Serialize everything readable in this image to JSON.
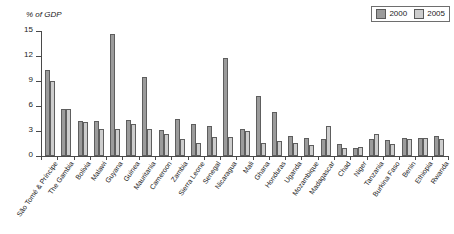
{
  "chart_data": {
    "type": "bar",
    "title": "",
    "subtitle": "",
    "ylabel": "% of GDP",
    "xlabel": "",
    "ylim": [
      0,
      15
    ],
    "yticks": [
      0,
      3,
      6,
      9,
      12,
      15
    ],
    "grid": false,
    "legend_position": "top-right",
    "categories": [
      "São Tomé & Príncipe",
      "The Gambia",
      "Bolivia",
      "Malawi",
      "Guyana",
      "Guinea",
      "Mauritania",
      "Cameroon",
      "Zambia",
      "Sierra Leone",
      "Senegal",
      "Nicaragua",
      "Mali",
      "Ghana",
      "Honduras",
      "Uganda",
      "Mozambique",
      "Madagascar",
      "Chad",
      "Niger",
      "Tanzania",
      "Burkina Faso",
      "Benin",
      "Ethiopia",
      "Rwanda"
    ],
    "series": [
      {
        "name": "2000",
        "color": "#9b9b9b",
        "values": [
          10.3,
          5.6,
          4.2,
          4.2,
          14.6,
          4.3,
          9.5,
          3.1,
          4.4,
          3.9,
          3.6,
          11.8,
          3.2,
          7.2,
          5.3,
          2.4,
          2.2,
          2.0,
          1.5,
          1.0,
          2.0,
          1.9,
          2.2,
          2.2,
          2.4
        ],
        "unit": "% of GDP"
      },
      {
        "name": "2005",
        "color": "#cdcdcd",
        "values": [
          9.0,
          5.6,
          4.1,
          3.3,
          3.2,
          3.9,
          3.2,
          2.7,
          2.1,
          1.6,
          2.3,
          2.3,
          3.0,
          1.6,
          1.8,
          1.6,
          1.3,
          3.6,
          1.0,
          1.1,
          2.6,
          1.5,
          2.0,
          2.2,
          2.1
        ],
        "unit": "% of GDP"
      }
    ]
  },
  "legend": {
    "items": [
      {
        "label": "2000",
        "color": "#9b9b9b"
      },
      {
        "label": "2005",
        "color": "#cdcdcd"
      }
    ]
  },
  "axis": {
    "y_title": "% of GDP"
  }
}
